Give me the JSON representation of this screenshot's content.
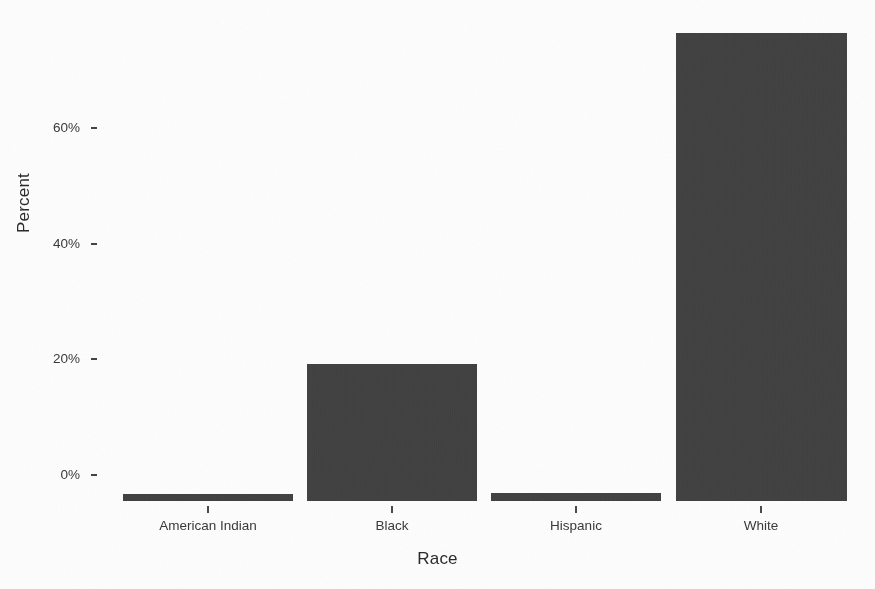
{
  "chart_data": {
    "type": "bar",
    "title": "",
    "xlabel": "Race",
    "ylabel": "Percent",
    "categories": [
      "American Indian",
      "Black",
      "Hispanic",
      "White"
    ],
    "values": [
      1,
      23.5,
      1.2,
      80.5
    ],
    "value_labels": [
      "1%",
      "23.5%",
      "1.2%",
      "80.5%"
    ],
    "ylim": [
      0,
      81
    ],
    "ytick_values": [
      0,
      20,
      40,
      60
    ],
    "ytick_labels": [
      "0%",
      "20%",
      "40%",
      "60%"
    ],
    "grid": false,
    "legend": "none",
    "bar_color": "#404040",
    "note": "White bar extends past the top edge of the cropped image"
  },
  "axes": {
    "y_title": "Percent",
    "x_title": "Race"
  },
  "colors": {
    "bar": "#404040",
    "axis_text": "#3a3a3a",
    "title_text": "#2b2b2b",
    "background": "#fdfdfd"
  },
  "artifacts": {
    "top_cutoff_text": ""
  }
}
